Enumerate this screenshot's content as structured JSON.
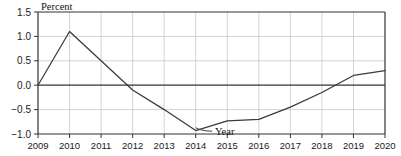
{
  "chart_data": {
    "type": "line",
    "title": "",
    "xlabel": "Year",
    "ylabel": "Percent",
    "x": [
      2009,
      2010,
      2011,
      2012,
      2013,
      2014,
      2015,
      2016,
      2017,
      2018,
      2019,
      2020
    ],
    "categories": [
      "2009",
      "2010",
      "2011",
      "2012",
      "2013",
      "2014",
      "2015",
      "2016",
      "2017",
      "2018",
      "2019",
      "2020"
    ],
    "values": [
      0.0,
      1.1,
      0.5,
      -0.1,
      -0.5,
      -0.93,
      -0.73,
      -0.7,
      -0.45,
      -0.15,
      0.2,
      0.3
    ],
    "series": [
      {
        "name": "Percent",
        "values": [
          0.0,
          1.1,
          0.5,
          -0.1,
          -0.5,
          -0.93,
          -0.73,
          -0.7,
          -0.45,
          -0.15,
          0.2,
          0.3
        ]
      }
    ],
    "ylim": [
      -1.0,
      1.5
    ],
    "xlim": [
      2009,
      2020
    ],
    "yticks": [
      1.5,
      1.0,
      0.5,
      0.0,
      -0.5,
      -1.0
    ],
    "ytick_labels": [
      "1.5",
      "1.0",
      "0.5",
      "0.0",
      "-0.5",
      "-1.0"
    ],
    "xticks": [
      2009,
      2010,
      2011,
      2012,
      2013,
      2014,
      2015,
      2016,
      2017,
      2018,
      2019,
      2020
    ],
    "xtick_labels": [
      "2009",
      "2010",
      "2011",
      "2012",
      "2013",
      "2014",
      "2015",
      "2016",
      "2017",
      "2018",
      "2019",
      "2020"
    ],
    "grid": true,
    "grid_axis": "both",
    "legend": false,
    "legend_position": "none",
    "zero_line": 0.0,
    "annotations": [
      {
        "text": "Year",
        "x": 2014.55,
        "y": -0.93,
        "leader_to_x": 2014.0,
        "leader_to_y": -0.93
      }
    ],
    "colors": {
      "line": "#3a3a3a",
      "grid": "#c8c8c8",
      "axis": "#333333",
      "zero_line": "#333333",
      "background": "#ffffff",
      "text": "#111111"
    }
  }
}
